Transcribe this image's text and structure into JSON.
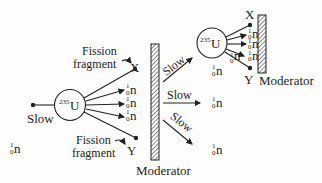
{
  "diagram": {
    "colors": {
      "ink": "#222222",
      "background": "#fefefe"
    },
    "incoming_neutron": {
      "symbol": "n",
      "mass": "1",
      "charge": "0",
      "label": "Slow"
    },
    "nucleus_left": {
      "symbol": "U",
      "mass": "235"
    },
    "nucleus_right": {
      "symbol": "U",
      "mass": "235"
    },
    "fragment_top": {
      "label_line1": "Fission",
      "label_line2": "fragment",
      "symbol": "X"
    },
    "fragment_bottom": {
      "label_line1": "Fission",
      "label_line2": "fragment",
      "symbol": "Y"
    },
    "emitted_neutrons": [
      {
        "symbol": "n",
        "mass": "1",
        "charge": "0"
      },
      {
        "symbol": "n",
        "mass": "1",
        "charge": "0"
      },
      {
        "symbol": "n",
        "mass": "1",
        "charge": "0"
      }
    ],
    "moderator_main": {
      "label": "Moderator"
    },
    "moderator_right": {
      "label": "Moderator"
    },
    "slow_paths": [
      {
        "label": "Slow"
      },
      {
        "label": "Slow"
      },
      {
        "label": "Slow"
      }
    ],
    "slow_neutrons": [
      {
        "symbol": "n",
        "mass": "1",
        "charge": "0"
      },
      {
        "symbol": "n",
        "mass": "1",
        "charge": "0"
      },
      {
        "symbol": "n",
        "mass": "1",
        "charge": "0"
      }
    ],
    "right_products": {
      "top": "X",
      "bottom": "Y",
      "neutrons": [
        {
          "symbol": "n",
          "mass": "1",
          "charge": "0"
        },
        {
          "symbol": "n",
          "mass": "1",
          "charge": "0"
        },
        {
          "symbol": "n",
          "mass": "1",
          "charge": "0"
        },
        {
          "symbol": "n",
          "mass": "1",
          "charge": "0"
        }
      ]
    }
  }
}
